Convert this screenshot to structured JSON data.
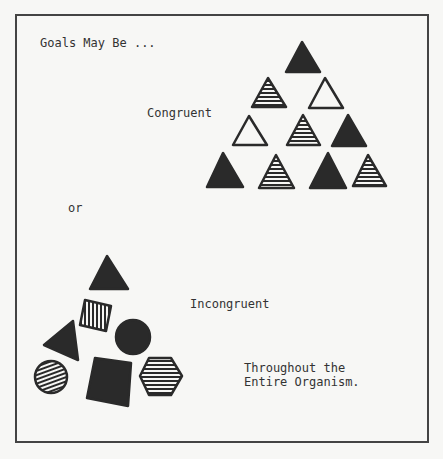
{
  "title": "Goals May Be ...",
  "labels": {
    "congruent": "Congruent",
    "or": "or",
    "incongruent": "Incongruent",
    "footer_line1": "Throughout the",
    "footer_line2": "Entire Organism."
  },
  "congruent_group": {
    "shape": "triangle",
    "rows": [
      [
        "solid"
      ],
      [
        "striped",
        "outline"
      ],
      [
        "outline",
        "striped",
        "solid"
      ],
      [
        "solid",
        "striped",
        "solid",
        "striped"
      ]
    ]
  },
  "incongruent_group": {
    "shapes": [
      {
        "shape": "triangle",
        "fill": "solid"
      },
      {
        "shape": "square",
        "fill": "vertical-stripes"
      },
      {
        "shape": "triangle",
        "fill": "solid"
      },
      {
        "shape": "circle",
        "fill": "solid"
      },
      {
        "shape": "circle",
        "fill": "diagonal-stripes"
      },
      {
        "shape": "square",
        "fill": "solid"
      },
      {
        "shape": "hexagon",
        "fill": "horizontal-stripes"
      }
    ]
  },
  "colors": {
    "ink": "#2a2a2a",
    "paper": "#f7f7f5",
    "frame": "#444444"
  }
}
